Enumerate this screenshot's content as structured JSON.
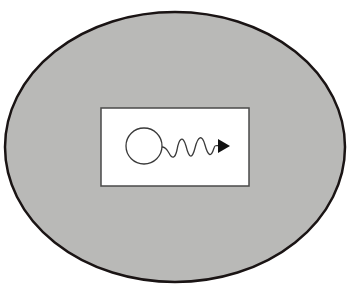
{
  "diagram": {
    "colors": {
      "background": "#ffffff",
      "ellipse_fill": "#b9b9b7",
      "ellipse_stroke": "#1a1414",
      "box_fill": "#ffffff",
      "box_stroke": "#4a4a4a",
      "symbol_stroke": "#3a3a3a",
      "arrow_fill": "#111111"
    },
    "icons": {
      "circle": "circle-icon",
      "wave": "wave-icon",
      "arrow": "arrowhead-icon"
    }
  }
}
